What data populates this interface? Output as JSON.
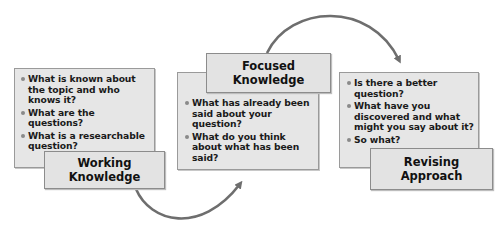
{
  "diagram": {
    "colors": {
      "box_fill": "#e6e6e6",
      "box_border": "#9a9a9a",
      "arrow": "#6e6e6e",
      "text": "#111111"
    },
    "stages": [
      {
        "title_line1": "Working",
        "title_line2": "Knowledge",
        "bullets": [
          "What is known about the topic and who knows it?",
          "What are the questions?",
          "What is a researchable question?"
        ]
      },
      {
        "title_line1": "Focused",
        "title_line2": "Knowledge",
        "bullets": [
          "What has already been said about your question?",
          "What do you think about what has been said?"
        ]
      },
      {
        "title_line1": "Revising",
        "title_line2": "Approach",
        "bullets": [
          "Is there a better question?",
          "What have you discovered and what might you say about it?",
          "So what?"
        ]
      }
    ],
    "arrows": [
      {
        "from": "Working Knowledge",
        "to": "Focused Knowledge"
      },
      {
        "from": "Focused Knowledge",
        "to": "Revising Approach"
      }
    ]
  }
}
